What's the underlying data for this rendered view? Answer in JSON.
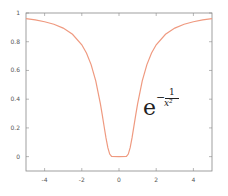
{
  "chart_data": {
    "type": "line",
    "title": "",
    "xlabel": "",
    "ylabel": "",
    "function": "e^(-1/x^2)",
    "annotation": {
      "base": "e",
      "exponent_sign": "−",
      "exponent_numerator": "1",
      "exponent_denominator": "x²"
    },
    "xlim": [
      -5,
      5
    ],
    "ylim": [
      -0.1,
      1.0
    ],
    "x_ticks": [
      -4,
      -2,
      0,
      2,
      4
    ],
    "x_tick_labels": [
      "-4",
      "-2",
      "0",
      "2",
      "4"
    ],
    "y_ticks": [
      0,
      0.2,
      0.4,
      0.6,
      0.8,
      1
    ],
    "y_tick_labels": [
      "0",
      "0.2",
      "0.4",
      "0.6",
      "0.8",
      "1"
    ],
    "grid": false,
    "legend": null,
    "series": [
      {
        "name": "e^(-1/x^2)",
        "color": "#ef9a80",
        "x": [
          -5,
          -4.5,
          -4,
          -3.5,
          -3,
          -2.5,
          -2,
          -1.75,
          -1.5,
          -1.25,
          -1,
          -0.9,
          -0.8,
          -0.7,
          -0.6,
          -0.5,
          -0.4,
          0,
          0.4,
          0.5,
          0.6,
          0.7,
          0.8,
          0.9,
          1,
          1.25,
          1.5,
          1.75,
          2,
          2.5,
          3,
          3.5,
          4,
          4.5,
          5
        ],
        "y": [
          0.961,
          0.952,
          0.939,
          0.922,
          0.895,
          0.852,
          0.779,
          0.721,
          0.641,
          0.527,
          0.368,
          0.291,
          0.21,
          0.13,
          0.062,
          0.018,
          0.002,
          0,
          0.002,
          0.018,
          0.062,
          0.13,
          0.21,
          0.291,
          0.368,
          0.527,
          0.641,
          0.721,
          0.779,
          0.852,
          0.895,
          0.922,
          0.939,
          0.952,
          0.961
        ]
      }
    ]
  },
  "colors": {
    "axis": "#888888",
    "curve": "#ef9a80",
    "background": "#ffffff"
  }
}
